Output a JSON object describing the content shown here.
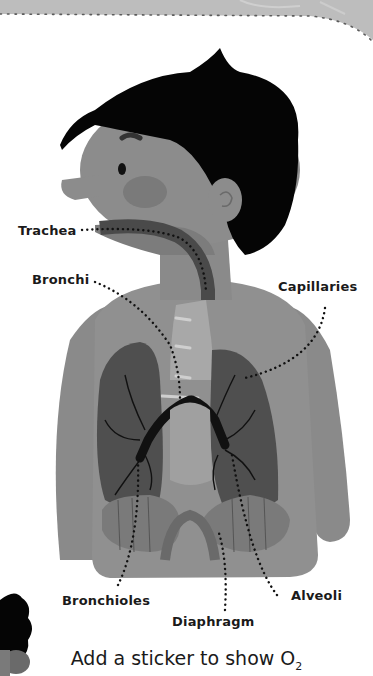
{
  "diagram": {
    "labels": {
      "trachea": "Trachea",
      "bronchi": "Bronchi",
      "capillaries": "Capillaries",
      "bronchioles": "Bronchioles",
      "alveoli": "Alveoli",
      "diaphragm": "Diaphragm"
    },
    "caption": {
      "text": "Add a sticker to show O",
      "subscript": "2"
    },
    "colors": {
      "skin": "#8a8a8a",
      "hair": "#050505",
      "lung": "#4f4f4f",
      "airway": "#111111",
      "trachea": "#4a4a4a",
      "border_band": "#bdbdbd",
      "background": "#ffffff"
    }
  }
}
